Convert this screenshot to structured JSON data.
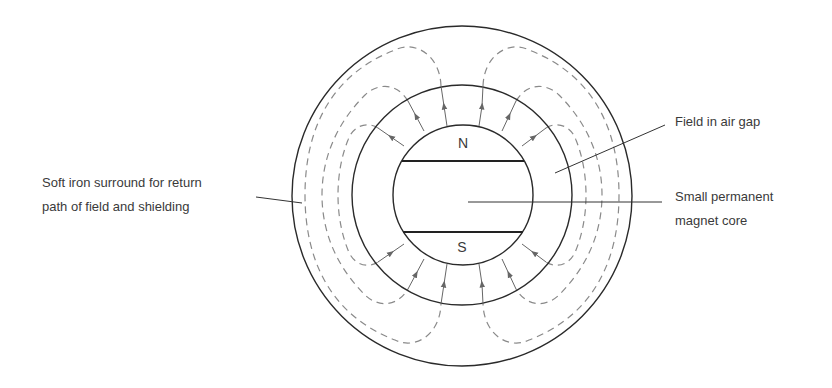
{
  "diagram": {
    "type": "cross-section",
    "labels": {
      "soft_iron": [
        "Soft iron surround for return",
        "path of field and shielding"
      ],
      "air_gap": "Field in air gap",
      "core": [
        "Small permanent",
        "magnet core"
      ]
    },
    "poles": {
      "north": "N",
      "south": "S"
    },
    "colors": {
      "line": "#2a2a2a",
      "field": "#777777",
      "text": "#3a3a3a"
    }
  }
}
